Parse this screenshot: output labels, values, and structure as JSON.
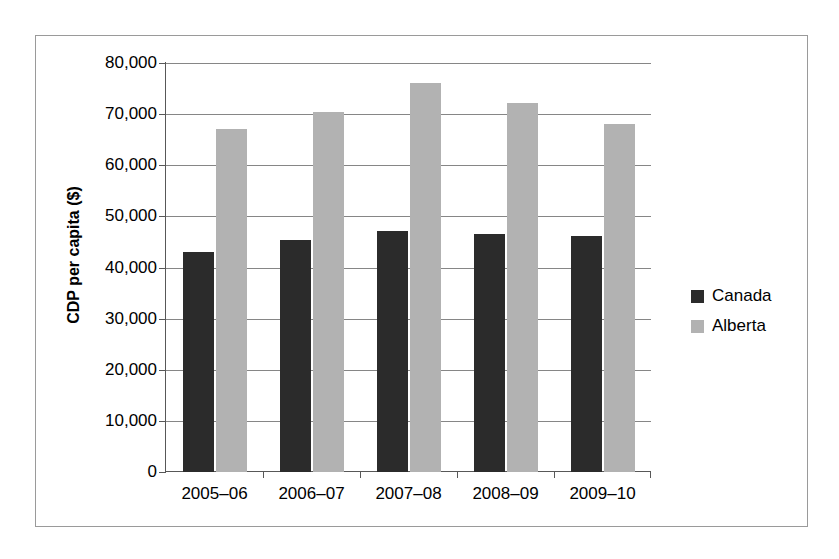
{
  "chart_data": {
    "type": "bar",
    "title": "",
    "xlabel": "",
    "ylabel": "CDP per capita ($)",
    "categories": [
      "2005–06",
      "2006–07",
      "2007–08",
      "2008–09",
      "2009–10"
    ],
    "series": [
      {
        "name": "Canada",
        "color": "#2b2b2b",
        "values": [
          43000,
          45400,
          47200,
          46500,
          46200
        ]
      },
      {
        "name": "Alberta",
        "color": "#b2b2b2",
        "values": [
          67000,
          70500,
          76000,
          72200,
          68000
        ]
      }
    ],
    "ylim": [
      0,
      80000
    ],
    "ytick_values": [
      0,
      10000,
      20000,
      30000,
      40000,
      50000,
      60000,
      70000,
      80000
    ],
    "ytick_labels": [
      "0",
      "10,000",
      "20,000",
      "30,000",
      "40,000",
      "50,000",
      "60,000",
      "70,000",
      "80,000"
    ],
    "grid": "horizontal",
    "legend_position": "right",
    "frame": true
  }
}
